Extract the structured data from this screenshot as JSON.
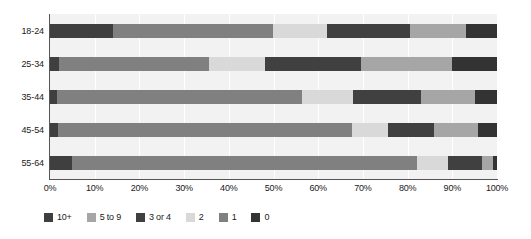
{
  "chart_data": {
    "type": "bar",
    "orientation": "horizontal",
    "stacked": true,
    "normalized": true,
    "title": "",
    "subtitle": "",
    "xlabel": "",
    "ylabel": "",
    "xlim": [
      0,
      100
    ],
    "xtick_labels": [
      "0%",
      "10%",
      "20%",
      "30%",
      "40%",
      "50%",
      "60%",
      "70%",
      "80%",
      "90%",
      "100%"
    ],
    "xtick_values": [
      0,
      10,
      20,
      30,
      40,
      50,
      60,
      70,
      80,
      90,
      100
    ],
    "grid": "vertical",
    "legend_position": "bottom",
    "categories": [
      "18-24",
      "25-34",
      "35-44",
      "45-54",
      "55-64"
    ],
    "series": [
      {
        "name": "10+",
        "color": "#3f3f3f",
        "values": [
          14.0,
          2.0,
          1.6,
          1.8,
          5.0
        ]
      },
      {
        "name": "5 to 9",
        "color": "#a6a6a6",
        "values": [
          0.0,
          0.0,
          0.0,
          0.0,
          0.0
        ]
      },
      {
        "name": "3 or 4",
        "color": "#404040",
        "values": [
          0.0,
          0.0,
          0.0,
          0.0,
          0.0
        ]
      },
      {
        "name": "2",
        "color": "#d9d9d9",
        "values": [
          0.0,
          0.0,
          0.0,
          0.0,
          0.0
        ]
      },
      {
        "name": "1",
        "color": "#808080",
        "values": [
          36.0,
          33.5,
          54.8,
          65.8,
          77.0
        ]
      },
      {
        "name": "0",
        "color": "#333333",
        "values": [
          0.0,
          0.0,
          0.0,
          0.0,
          0.0
        ]
      }
    ],
    "stack_order": [
      "10+",
      "1",
      "2",
      "3 or 4",
      "5 to 9",
      "0"
    ],
    "bars": [
      {
        "category": "18-24",
        "segments": [
          {
            "series": "10+",
            "value": 14.0,
            "color": "#3f3f3f"
          },
          {
            "series": "1",
            "value": 36.0,
            "color": "#808080"
          },
          {
            "series": "2",
            "value": 12.0,
            "color": "#d9d9d9"
          },
          {
            "series": "3 or 4",
            "value": 18.5,
            "color": "#404040"
          },
          {
            "series": "5 to 9",
            "value": 12.5,
            "color": "#a6a6a6"
          },
          {
            "series": "0",
            "value": 7.0,
            "color": "#333333"
          }
        ]
      },
      {
        "category": "25-34",
        "segments": [
          {
            "series": "10+",
            "value": 2.0,
            "color": "#3f3f3f"
          },
          {
            "series": "1",
            "value": 33.5,
            "color": "#808080"
          },
          {
            "series": "2",
            "value": 12.5,
            "color": "#d9d9d9"
          },
          {
            "series": "3 or 4",
            "value": 21.5,
            "color": "#404040"
          },
          {
            "series": "5 to 9",
            "value": 20.5,
            "color": "#a6a6a6"
          },
          {
            "series": "0",
            "value": 10.0,
            "color": "#333333"
          }
        ]
      },
      {
        "category": "35-44",
        "segments": [
          {
            "series": "10+",
            "value": 1.6,
            "color": "#3f3f3f"
          },
          {
            "series": "1",
            "value": 54.8,
            "color": "#808080"
          },
          {
            "series": "2",
            "value": 11.4,
            "color": "#d9d9d9"
          },
          {
            "series": "3 or 4",
            "value": 15.2,
            "color": "#404040"
          },
          {
            "series": "5 to 9",
            "value": 12.0,
            "color": "#a6a6a6"
          },
          {
            "series": "0",
            "value": 5.0,
            "color": "#333333"
          }
        ]
      },
      {
        "category": "45-54",
        "segments": [
          {
            "series": "10+",
            "value": 1.8,
            "color": "#3f3f3f"
          },
          {
            "series": "1",
            "value": 65.8,
            "color": "#808080"
          },
          {
            "series": "2",
            "value": 8.0,
            "color": "#d9d9d9"
          },
          {
            "series": "3 or 4",
            "value": 10.4,
            "color": "#404040"
          },
          {
            "series": "5 to 9",
            "value": 9.7,
            "color": "#a6a6a6"
          },
          {
            "series": "0",
            "value": 4.3,
            "color": "#333333"
          }
        ]
      },
      {
        "category": "55-64",
        "segments": [
          {
            "series": "10+",
            "value": 5.0,
            "color": "#3f3f3f"
          },
          {
            "series": "1",
            "value": 77.0,
            "color": "#808080"
          },
          {
            "series": "2",
            "value": 7.0,
            "color": "#d9d9d9"
          },
          {
            "series": "3 or 4",
            "value": 7.6,
            "color": "#404040"
          },
          {
            "series": "5 to 9",
            "value": 2.4,
            "color": "#a6a6a6"
          },
          {
            "series": "0",
            "value": 1.0,
            "color": "#333333"
          }
        ]
      }
    ],
    "legend": [
      {
        "label": "10+",
        "color": "#3f3f3f"
      },
      {
        "label": "5 to 9",
        "color": "#a6a6a6"
      },
      {
        "label": "3 or 4",
        "color": "#404040"
      },
      {
        "label": "2",
        "color": "#d9d9d9"
      },
      {
        "label": "1",
        "color": "#808080"
      },
      {
        "label": "0",
        "color": "#333333"
      }
    ],
    "colors": {
      "plot_background": "#f2f2f2",
      "gridline": "#ffffff",
      "axis": "#555555",
      "text": "#1a1a1a"
    }
  }
}
